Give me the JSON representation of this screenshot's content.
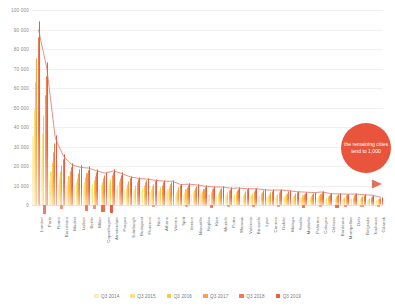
{
  "chart_data": {
    "type": "bar",
    "title": "",
    "subtitle": "",
    "xlabel": "",
    "ylabel": "",
    "ylim": [
      -5000,
      100000
    ],
    "grid": true,
    "legend_position": "bottom",
    "ytick_labels": [
      "100 000",
      "90 000",
      "80 000",
      "70 000",
      "60 000",
      "50 000",
      "40 000",
      "30 000",
      "20 000",
      "10 000",
      "0"
    ],
    "ytick_values": [
      100000,
      90000,
      80000,
      70000,
      60000,
      50000,
      40000,
      30000,
      20000,
      10000,
      0
    ],
    "categories": [
      "London",
      "Paris",
      "Rome",
      "Barcelona",
      "Madrid",
      "Lisbon",
      "Berlin",
      "Milan",
      "Copenhagen",
      "Amsterdam",
      "Prague",
      "Edinburgh",
      "Budapest",
      "Florence",
      "Nice",
      "Athens",
      "Vienna",
      "Split",
      "Venice",
      "Marseille",
      "Naples",
      "Kiev",
      "Munich",
      "Porto",
      "Warsaw",
      "Valencia",
      "Brussels",
      "Lyon",
      "Cannes",
      "Dublin",
      "Malaga",
      "Seville",
      "Marbella",
      "Palermo",
      "Cologne",
      "Odessa",
      "Bordeaux",
      "Montpellier",
      "Oslo",
      "Belgrade",
      "Toulouse",
      "Gdansk"
    ],
    "series": [
      {
        "name": "Q3 2014",
        "color": "#fdeec0",
        "values": [
          34000,
          26000,
          12500,
          10500,
          9500,
          9000,
          9800,
          8600,
          8000,
          9200,
          8400,
          7400,
          7000,
          7200,
          6600,
          6300,
          6700,
          5400,
          5600,
          5300,
          5000,
          4800,
          5100,
          4500,
          4600,
          4300,
          4400,
          4200,
          4000,
          4100,
          3800,
          3700,
          3500,
          3400,
          3600,
          3200,
          3100,
          3000,
          3050,
          2800,
          2700,
          2100
        ]
      },
      {
        "name": "Q3 2015",
        "color": "#fde47a",
        "values": [
          47000,
          35000,
          16500,
          13500,
          11800,
          11200,
          11500,
          10400,
          9700,
          11000,
          10000,
          8900,
          8400,
          8500,
          7900,
          7500,
          7900,
          6500,
          6700,
          6300,
          6000,
          5700,
          6000,
          5400,
          5500,
          5100,
          5200,
          5000,
          4800,
          4900,
          4500,
          4400,
          4200,
          4000,
          4300,
          3800,
          3700,
          3600,
          3650,
          3300,
          3200,
          2500
        ]
      },
      {
        "name": "Q3 2016",
        "color": "#fdc848",
        "values": [
          60000,
          44000,
          21000,
          16500,
          14200,
          13400,
          13600,
          12300,
          11400,
          12800,
          11700,
          10400,
          9900,
          9900,
          9200,
          8800,
          9100,
          7600,
          7800,
          7400,
          7000,
          6700,
          6900,
          6300,
          6400,
          6000,
          6100,
          5800,
          5600,
          5700,
          5300,
          5100,
          4900,
          4700,
          5000,
          4400,
          4300,
          4200,
          4250,
          3900,
          3700,
          2900
        ]
      },
      {
        "name": "Q3 2017",
        "color": "#f9a14a",
        "values": [
          72000,
          54000,
          26000,
          19500,
          16500,
          15600,
          15600,
          14200,
          13200,
          14600,
          13400,
          11900,
          11300,
          11200,
          10500,
          10100,
          10300,
          8700,
          8900,
          8500,
          8000,
          7700,
          7800,
          7200,
          7300,
          6900,
          7000,
          6600,
          6400,
          6500,
          6100,
          5800,
          5600,
          5400,
          5700,
          5000,
          4900,
          4800,
          4850,
          4500,
          4200,
          3300
        ]
      },
      {
        "name": "Q3 2018",
        "color": "#f27b4e",
        "values": [
          82000,
          63000,
          30500,
          22500,
          18800,
          17600,
          17400,
          16000,
          14900,
          16200,
          14900,
          13300,
          12600,
          12400,
          11700,
          11300,
          11400,
          9700,
          9900,
          9500,
          8900,
          8600,
          8600,
          8000,
          8100,
          7700,
          7800,
          7300,
          7100,
          7200,
          6800,
          6400,
          6200,
          6000,
          6300,
          5500,
          5400,
          5300,
          5350,
          5000,
          4700,
          3700
        ]
      },
      {
        "name": "Q3 2019",
        "color": "#ea5b45",
        "values": [
          90000,
          70000,
          34500,
          25000,
          20800,
          19400,
          19000,
          17600,
          16400,
          17600,
          16200,
          14500,
          13700,
          13400,
          12700,
          12300,
          12300,
          10600,
          10800,
          10400,
          9700,
          9400,
          9300,
          8700,
          8800,
          8400,
          8500,
          7900,
          7700,
          7800,
          7400,
          6900,
          6700,
          6500,
          6800,
          5900,
          5800,
          5700,
          5750,
          5400,
          5100,
          4000
        ]
      }
    ],
    "negative_bars": [
      {
        "category": "Paris",
        "value": -4200,
        "color": "#f07a63"
      },
      {
        "category": "Barcelona",
        "value": -1800,
        "color": "#f4937f"
      },
      {
        "category": "Berlin",
        "value": -3000,
        "color": "#f07a63"
      },
      {
        "category": "Milan",
        "value": -1900,
        "color": "#f4937f"
      },
      {
        "category": "Copenhagen",
        "value": -3200,
        "color": "#ee6a50"
      },
      {
        "category": "Amsterdam",
        "value": -3600,
        "color": "#ea5b45"
      },
      {
        "category": "Nice",
        "value": -900,
        "color": "#f4a08c"
      },
      {
        "category": "Venice",
        "value": -900,
        "color": "#f4a08c"
      },
      {
        "category": "Kiev",
        "value": -1500,
        "color": "#f07a63"
      },
      {
        "category": "Porto",
        "value": -900,
        "color": "#f4a08c"
      },
      {
        "category": "Brussels",
        "value": -1000,
        "color": "#f4937f"
      },
      {
        "category": "Dublin",
        "value": -900,
        "color": "#f4a08c"
      },
      {
        "category": "Marbella",
        "value": -1500,
        "color": "#f07a63"
      },
      {
        "category": "Cologne",
        "value": -900,
        "color": "#f4a08c"
      },
      {
        "category": "Bordeaux",
        "value": -1400,
        "color": "#ee6a50"
      },
      {
        "category": "Montpellier",
        "value": -1000,
        "color": "#f4937f"
      },
      {
        "category": "Belgrade",
        "value": -900,
        "color": "#f4a08c"
      },
      {
        "category": "Gdansk",
        "value": -700,
        "color": "#f4a08c"
      }
    ],
    "annotations": [
      {
        "type": "bubble",
        "text": "the remaining cities tend to 1,000",
        "color": "#e8553c"
      },
      {
        "type": "arrow",
        "direction": "right",
        "color": "#e2705c"
      }
    ]
  },
  "legend": {
    "items": [
      {
        "label": "Q3 2014",
        "color": "#fdeec0"
      },
      {
        "label": "Q3 2015",
        "color": "#fde47a"
      },
      {
        "label": "Q3 2016",
        "color": "#fdc848"
      },
      {
        "label": "Q3 2017",
        "color": "#f9a14a"
      },
      {
        "label": "Q3 2018",
        "color": "#f27b4e"
      },
      {
        "label": "Q3 2019",
        "color": "#ea5b45"
      }
    ]
  }
}
